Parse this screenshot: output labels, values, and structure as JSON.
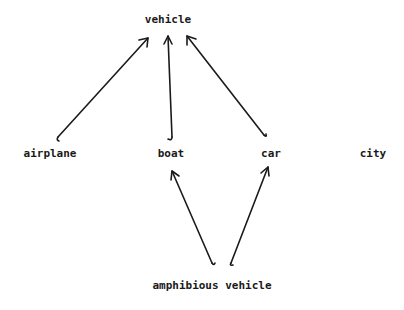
{
  "diagram": {
    "type": "hierarchy",
    "nodes": [
      {
        "id": "vehicle",
        "label": "vehicle",
        "x": 168,
        "y": 19
      },
      {
        "id": "airplane",
        "label": "airplane",
        "x": 50,
        "y": 153
      },
      {
        "id": "boat",
        "label": "boat",
        "x": 171,
        "y": 153
      },
      {
        "id": "car",
        "label": "car",
        "x": 271,
        "y": 153
      },
      {
        "id": "city",
        "label": "city",
        "x": 373,
        "y": 153
      },
      {
        "id": "amphibious_vehicle",
        "label": "amphibious vehicle",
        "x": 212,
        "y": 285
      }
    ],
    "edges": [
      {
        "from": "airplane",
        "to": "vehicle"
      },
      {
        "from": "boat",
        "to": "vehicle"
      },
      {
        "from": "car",
        "to": "vehicle"
      },
      {
        "from": "amphibious_vehicle",
        "to": "boat"
      },
      {
        "from": "amphibious_vehicle",
        "to": "car"
      }
    ],
    "colors": {
      "text": "#1a1a1a",
      "edge": "#1a1a1a",
      "background": "#ffffff"
    }
  }
}
